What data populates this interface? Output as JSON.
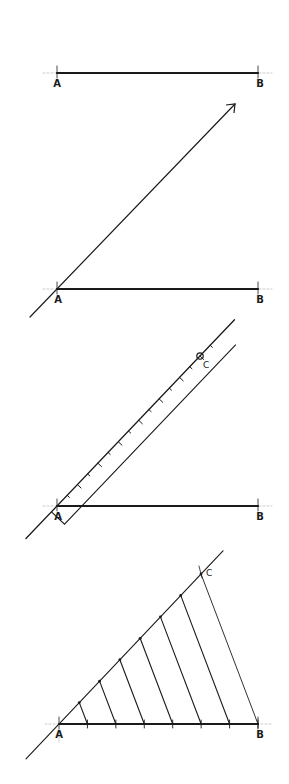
{
  "colors": {
    "ink": "#1a1a1a",
    "guide": "#b5b5b5",
    "background": "#ffffff"
  },
  "figures": [
    {
      "step": 1,
      "description": "Given line segment AB",
      "labels": {
        "a": "A",
        "b": "B"
      },
      "A": [
        57,
        73
      ],
      "B": [
        258,
        73
      ]
    },
    {
      "step": 2,
      "description": "Draw a ray from A at an acute angle",
      "labels": {
        "a": "A",
        "b": "B"
      },
      "A": [
        57,
        289
      ],
      "B": [
        258,
        289
      ],
      "ray_start": [
        30,
        317
      ],
      "ray_end": [
        235,
        104
      ]
    },
    {
      "step": 3,
      "description": "Lay a ruler along the ray and mark equal divisions to point C",
      "labels": {
        "a": "A",
        "b": "B",
        "c": "C"
      },
      "A": [
        57,
        506
      ],
      "B": [
        258,
        506
      ],
      "C": [
        200,
        356
      ],
      "divisions": 7,
      "minor_ticks": 14
    },
    {
      "step": 4,
      "description": "Join C to B and draw parallel lines through each division to AB",
      "labels": {
        "a": "A",
        "b": "B",
        "c": "C"
      },
      "A": [
        59,
        724
      ],
      "B": [
        258,
        724
      ],
      "C": [
        201,
        574
      ],
      "divisions": 7
    }
  ]
}
